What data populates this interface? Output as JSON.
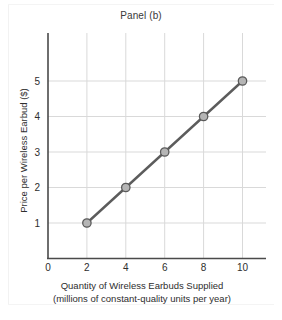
{
  "chart_data": {
    "type": "line",
    "title": "Panel (b)",
    "xlabel": "Quantity of Wireless Earbuds Supplied",
    "xlabel_line2": "(millions of constant-quality units per year)",
    "ylabel": "Price per Wireless Earbud ($)",
    "x": [
      2,
      4,
      6,
      8,
      10
    ],
    "values": [
      1,
      2,
      3,
      4,
      5
    ],
    "series": [
      {
        "name": "Supply",
        "points": [
          {
            "x": 2,
            "y": 1
          },
          {
            "x": 4,
            "y": 2
          },
          {
            "x": 6,
            "y": 3
          },
          {
            "x": 8,
            "y": 4
          },
          {
            "x": 10,
            "y": 5
          }
        ]
      }
    ],
    "xlim": [
      0,
      11.2
    ],
    "ylim": [
      0,
      6.35
    ],
    "xticks": [
      0,
      2,
      4,
      6,
      8,
      10
    ],
    "xtick_labels": [
      "0",
      "2",
      "4",
      "6",
      "8",
      "10"
    ],
    "yticks": [
      1,
      2,
      3,
      4,
      5
    ],
    "ytick_labels": [
      "1",
      "2",
      "3",
      "4",
      "5"
    ],
    "grid": true,
    "grid_axis": "both",
    "legend": false,
    "colors": {
      "line": "#5c5c5c",
      "marker_fill": "#b5b5b5",
      "marker_stroke": "#5a5a5a",
      "grid": "#d9d9d9",
      "axis": "#4a4a4a",
      "text": "#2e2e2e",
      "background": "#ffffff"
    }
  },
  "figure": {
    "title": "Panel (b)",
    "y_axis_label": "Price per Wireless Earbud ($)",
    "x_axis_label_line1": "Quantity of Wireless Earbuds Supplied",
    "x_axis_label_line2": "(millions of constant-quality units per year)",
    "tick_labels": {
      "x": [
        "0",
        "2",
        "4",
        "6",
        "8",
        "10"
      ],
      "y": [
        "1",
        "2",
        "3",
        "4",
        "5"
      ]
    }
  }
}
